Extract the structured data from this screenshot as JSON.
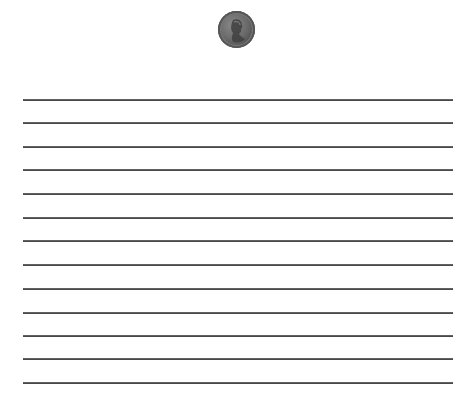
{
  "page": {
    "type": "lined-writing-paper",
    "header_image": {
      "icon": "penny-coin-icon",
      "description": "Lincoln one-cent coin"
    },
    "ruled_lines": {
      "count": 13,
      "color": "#4a4a4a",
      "left": 23,
      "right": 453,
      "y_positions": [
        100,
        123,
        147,
        170,
        194,
        218,
        241,
        265,
        289,
        313,
        336,
        359,
        383
      ]
    }
  }
}
